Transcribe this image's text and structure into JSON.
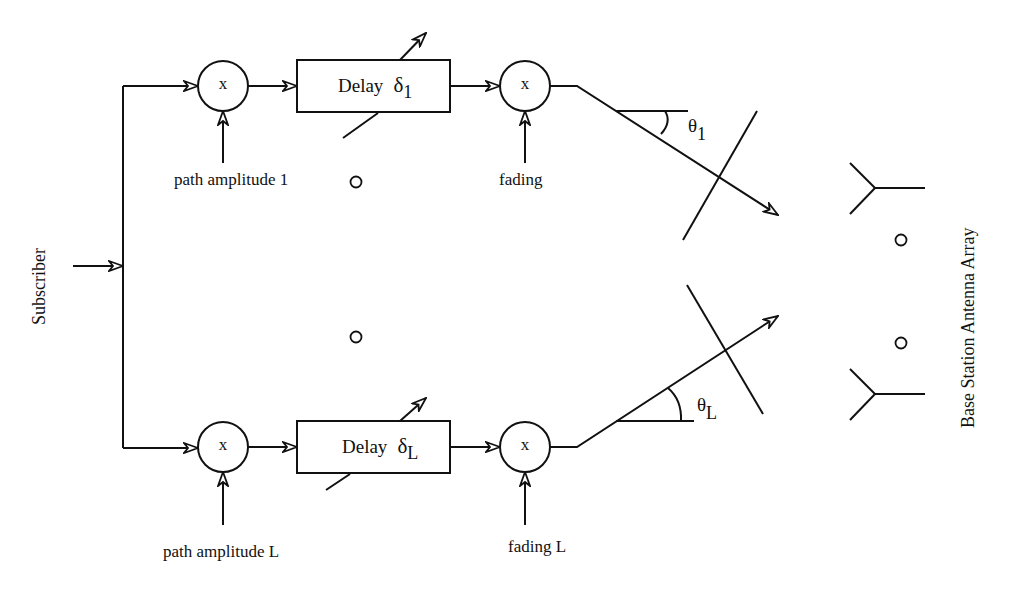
{
  "diagram": {
    "source_label": "Subscriber",
    "receiver_label": "Base Station Antenna Array",
    "multiplier_symbol": "x",
    "continuation_symbol": "o",
    "paths": [
      {
        "id": "1",
        "amplitude_label": "path amplitude 1",
        "delay_label": "Delay",
        "delay_symbol": "δ",
        "delay_subscript": "1",
        "fading_label": "fading",
        "angle_symbol": "θ",
        "angle_subscript": "1"
      },
      {
        "id": "L",
        "amplitude_label": "path amplitude L",
        "delay_label": "Delay",
        "delay_symbol": "δ",
        "delay_subscript": "L",
        "fading_label": "fading L",
        "angle_symbol": "θ",
        "angle_subscript": "L"
      }
    ],
    "antenna_count_shown": 2,
    "colors": {
      "stroke": "#111111",
      "background": "#ffffff"
    }
  }
}
